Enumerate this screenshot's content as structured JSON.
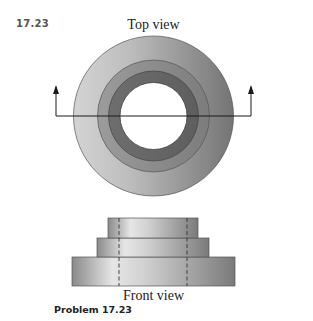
{
  "figure": {
    "problem_number": "17.23",
    "top_view_label": "Top view",
    "front_view_label": "Front view",
    "caption": "Problem 17.23"
  },
  "colors": {
    "outer_ring_light": "#c9c9c9",
    "outer_ring_dark": "#7a7a7a",
    "middle_ring": "#8e8e8e",
    "inner_ring": "#6b6b6b",
    "hole": "#ffffff",
    "line": "#1a1a1a"
  },
  "top_view": {
    "center": [
      153.5,
      116
    ],
    "radii": {
      "outer": 80,
      "middle": 56,
      "inner": 45,
      "hole": 33.5
    },
    "section_line": {
      "y": 116,
      "x_left": 56,
      "x_right": 251,
      "arrow_tip_y": 87
    }
  },
  "front_view": {
    "tiers": [
      {
        "name": "top",
        "x": 108,
        "y": 218,
        "width": 90,
        "height": 20
      },
      {
        "name": "middle",
        "x": 97,
        "y": 238,
        "width": 112,
        "height": 19
      },
      {
        "name": "bottom",
        "x": 72,
        "y": 257,
        "width": 163,
        "height": 29
      }
    ],
    "hidden_lines_x": [
      119,
      187
    ]
  }
}
